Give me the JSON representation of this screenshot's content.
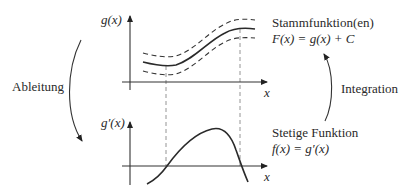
{
  "diagram": {
    "top_plot": {
      "y_axis_label": "g(x)",
      "x_axis_label": "x",
      "curves": [
        "g(x)",
        "g(x) + C (upper, dashed)",
        "g(x) - C (lower, dashed)"
      ]
    },
    "bottom_plot": {
      "y_axis_label": "g′(x)",
      "x_axis_label": "x",
      "curves": [
        "g′(x)"
      ]
    },
    "labels": {
      "antiderivative_title": "Stammfunktion(en)",
      "antiderivative_formula": "F(x) = g(x) + C",
      "continuous_title": "Stetige Funktion",
      "continuous_formula": "f(x) = g′(x)",
      "derivative_arrow": "Ableitung",
      "integration_arrow": "Integration"
    },
    "colors": {
      "line": "#2a2a2a",
      "guide": "#888888",
      "background": "#ffffff"
    }
  }
}
